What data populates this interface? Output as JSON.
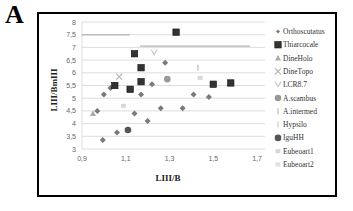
{
  "panel_label": "A",
  "chart_data": {
    "type": "scatter",
    "title": "",
    "xlabel": "LIII/B",
    "ylabel": "LIII/BmIII",
    "xlim": [
      0.9,
      1.7
    ],
    "ylim": [
      3,
      8
    ],
    "x_ticks": [
      "0,9",
      "1,1",
      "1,3",
      "1,5",
      "1,7"
    ],
    "y_ticks": [
      "3",
      "3,5",
      "4",
      "4,5",
      "5",
      "5,5",
      "6",
      "6,5",
      "7",
      "7,5",
      "8"
    ],
    "grid": true,
    "legend_position": "right",
    "series": [
      {
        "name": "Orthoscutatus",
        "marker": "diamond",
        "color": "#7a7a7a",
        "points": [
          [
            1.0,
            5.15
          ],
          [
            1.03,
            5.4
          ],
          [
            1.28,
            6.4
          ],
          [
            1.22,
            5.55
          ],
          [
            1.17,
            5.15
          ],
          [
            1.41,
            5.15
          ],
          [
            1.48,
            5.05
          ],
          [
            0.97,
            4.5
          ],
          [
            1.14,
            4.4
          ],
          [
            1.26,
            4.6
          ],
          [
            1.36,
            4.6
          ],
          [
            1.2,
            4.1
          ],
          [
            1.06,
            3.65
          ],
          [
            0.995,
            3.35
          ]
        ]
      },
      {
        "name": "Thiarcocale",
        "marker": "square",
        "color": "#333333",
        "points": [
          [
            1.14,
            6.75
          ],
          [
            1.17,
            6.2
          ],
          [
            1.17,
            5.65
          ],
          [
            1.05,
            5.5
          ],
          [
            1.12,
            5.35
          ],
          [
            1.33,
            7.6
          ],
          [
            1.5,
            5.55
          ],
          [
            1.58,
            5.6
          ]
        ]
      },
      {
        "name": "DineHolo",
        "marker": "triangle",
        "color": "#aaaaaa",
        "points": [
          [
            0.95,
            4.4
          ]
        ]
      },
      {
        "name": "DineTopo",
        "marker": "x",
        "color": "#b0b0b0",
        "points": [
          [
            1.07,
            5.85
          ]
        ]
      },
      {
        "name": "LCR8.7",
        "marker": "v",
        "color": "#c8c8c8",
        "points": [
          [
            1.23,
            6.8
          ]
        ]
      },
      {
        "name": "A.scambus",
        "marker": "circle",
        "color": "#999999",
        "points": [
          [
            1.29,
            5.75
          ]
        ]
      },
      {
        "name": "A.intermed",
        "marker": "dash",
        "color": "#bbbbbb",
        "points": [
          [
            1.43,
            6.2
          ]
        ]
      },
      {
        "name": "Hypsilo",
        "marker": "dash",
        "color": "#cccccc",
        "points": []
      },
      {
        "name": "IguHH",
        "marker": "circle",
        "color": "#555555",
        "points": [
          [
            1.11,
            3.75
          ]
        ]
      },
      {
        "name": "Eubeoart1",
        "marker": "square-light",
        "color": "#d8d8d8",
        "points": [
          [
            1.09,
            4.7
          ],
          [
            1.44,
            5.8
          ]
        ]
      },
      {
        "name": "Eubeoart2",
        "marker": "square-light",
        "color": "#e0e0e0",
        "points": []
      }
    ]
  }
}
